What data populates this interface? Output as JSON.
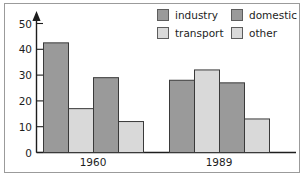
{
  "chart_data": {
    "type": "bar",
    "title": "",
    "subtitle": "",
    "xlabel": "",
    "ylabel": "",
    "categories": [
      "1960",
      "1989"
    ],
    "ylim": [
      0,
      50
    ],
    "yticks": [
      0,
      10,
      20,
      30,
      40,
      50
    ],
    "grid": false,
    "legend_position": "top-right",
    "series": [
      {
        "name": "industry",
        "values": [
          42.5,
          28
        ],
        "color": "#9a9a9a"
      },
      {
        "name": "transport",
        "values": [
          17,
          32
        ],
        "color": "#d9d9d9"
      },
      {
        "name": "domestic",
        "values": [
          29,
          27
        ],
        "color": "#9a9a9a"
      },
      {
        "name": "other",
        "values": [
          12,
          13
        ],
        "color": "#d9d9d9"
      }
    ],
    "legend_order": [
      "industry",
      "domestic",
      "transport",
      "other"
    ],
    "axis_arrow": true
  },
  "colors": {
    "dark_fill": "#9a9a9a",
    "light_fill": "#d9d9d9",
    "bar_outline": "#3a3a3a",
    "axis": "#1d1d1d",
    "frame": "#9b9b9b",
    "text": "#1d1d1d"
  }
}
